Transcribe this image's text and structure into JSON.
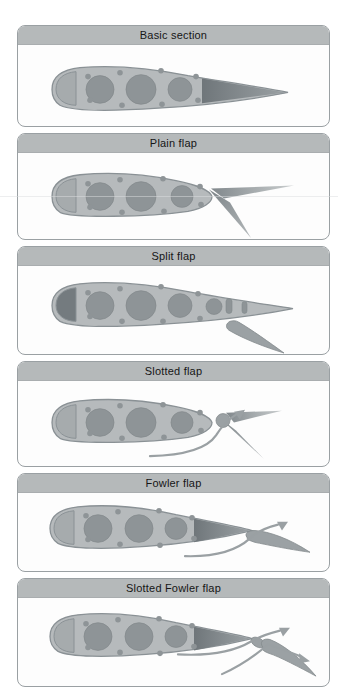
{
  "panels": [
    {
      "label": "Basic section",
      "name": "basic-section"
    },
    {
      "label": "Plain flap",
      "name": "plain-flap"
    },
    {
      "label": "Split flap",
      "name": "split-flap"
    },
    {
      "label": "Slotted flap",
      "name": "slotted-flap"
    },
    {
      "label": "Fowler flap",
      "name": "fowler-flap"
    },
    {
      "label": "Slotted Fowler flap",
      "name": "slotted-fowler-flap"
    }
  ],
  "colors": {
    "header-bg": "#b5b9ba",
    "panel-border": "#9aa0a3",
    "panel-bg": "#fdfdfd",
    "page-bg": "#ffffff",
    "outline": "#8a9195",
    "body-fill": "#b6babc",
    "nose-fill": "#a6abad",
    "hole-fill": "#8e9497",
    "dark-fill": "#747b7f",
    "flap-fill": "#9ba1a4",
    "flap-stroke": "#848b8e",
    "arrow": "#9aa0a3",
    "header-text": "#161616"
  }
}
